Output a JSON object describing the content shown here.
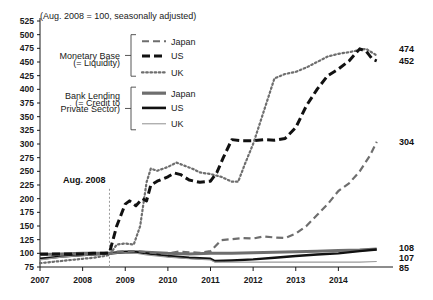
{
  "chart_data": {
    "type": "line",
    "title": "",
    "subtitle": "(Aug. 2008 = 100, seasonally adjusted)",
    "xlabel": "",
    "ylabel": "",
    "ylim": [
      75,
      525
    ],
    "xlim": [
      2007.0,
      2015.0
    ],
    "y_ticks": [
      75,
      100,
      125,
      150,
      175,
      200,
      225,
      250,
      275,
      300,
      325,
      350,
      375,
      400,
      425,
      450,
      475,
      500,
      525
    ],
    "x_ticks": [
      2007,
      2008,
      2009,
      2010,
      2011,
      2012,
      2013,
      2014
    ],
    "x_tick_labels": [
      "2007",
      "2008",
      "2009",
      "2010",
      "2011",
      "2012",
      "2013",
      "2014"
    ],
    "grid": false,
    "legend_position": "upper-left-inside",
    "annotations": [
      {
        "text": "Aug. 2008",
        "x": 2008.63,
        "y": 233,
        "type": "vline-label"
      }
    ],
    "vline": {
      "x": 2008.63,
      "label": "Aug. 2008",
      "style": "dotted",
      "color": "#9a9a9a"
    },
    "end_labels": [
      {
        "text": "474",
        "series": "Monetary Base UK",
        "value": 474
      },
      {
        "text": "452",
        "series": "Monetary Base US",
        "value": 452
      },
      {
        "text": "304",
        "series": "Monetary Base Japan",
        "value": 304
      },
      {
        "text": "108",
        "series": "Bank Lending Japan",
        "value": 108
      },
      {
        "text": "107",
        "series": "Bank Lending US",
        "value": 107
      },
      {
        "text": "85",
        "series": "Bank Lending UK",
        "value": 85
      }
    ],
    "series": [
      {
        "name": "Japan",
        "group": "Monetary Base (= Liquidity)",
        "style": "dashed",
        "color": "#6e6e6e",
        "width": 2.2,
        "dash": "7,4",
        "x": [
          2007.0,
          2007.25,
          2007.5,
          2007.75,
          2008.0,
          2008.25,
          2008.5,
          2008.63,
          2008.75,
          2009.0,
          2009.25,
          2009.5,
          2009.75,
          2010.0,
          2010.25,
          2010.5,
          2010.75,
          2011.0,
          2011.25,
          2011.5,
          2011.75,
          2012.0,
          2012.25,
          2012.5,
          2012.75,
          2013.0,
          2013.25,
          2013.5,
          2013.75,
          2014.0,
          2014.25,
          2014.5,
          2014.75,
          2014.9
        ],
        "values": [
          98,
          97,
          98,
          99,
          99,
          99,
          100,
          100,
          103,
          104,
          104,
          102,
          100,
          100,
          103,
          102,
          101,
          104,
          124,
          126,
          128,
          127,
          131,
          129,
          128,
          136,
          150,
          170,
          190,
          214,
          228,
          250,
          280,
          304
        ]
      },
      {
        "name": "US",
        "group": "Monetary Base (= Liquidity)",
        "style": "dashed-bold",
        "color": "#111111",
        "width": 3.0,
        "dash": "8,4",
        "x": [
          2007.0,
          2007.25,
          2007.5,
          2007.75,
          2008.0,
          2008.25,
          2008.5,
          2008.63,
          2008.8,
          2009.0,
          2009.1,
          2009.25,
          2009.4,
          2009.5,
          2009.6,
          2009.75,
          2010.0,
          2010.15,
          2010.3,
          2010.5,
          2010.75,
          2011.0,
          2011.15,
          2011.3,
          2011.5,
          2011.75,
          2012.0,
          2012.25,
          2012.5,
          2012.75,
          2013.0,
          2013.25,
          2013.5,
          2013.75,
          2014.0,
          2014.25,
          2014.5,
          2014.65,
          2014.8,
          2014.9
        ],
        "values": [
          99,
          99,
          99,
          99,
          99,
          100,
          100,
          101,
          150,
          190,
          196,
          187,
          200,
          196,
          225,
          232,
          240,
          247,
          244,
          234,
          230,
          232,
          248,
          275,
          308,
          306,
          306,
          308,
          307,
          310,
          330,
          370,
          400,
          425,
          437,
          452,
          474,
          470,
          455,
          452
        ]
      },
      {
        "name": "UK",
        "group": "Monetary Base (= Liquidity)",
        "style": "dotted",
        "color": "#6e6e6e",
        "width": 2.2,
        "dash": "1.6,2.6",
        "x": [
          2007.0,
          2007.25,
          2007.5,
          2007.75,
          2008.0,
          2008.25,
          2008.5,
          2008.63,
          2008.8,
          2009.0,
          2009.2,
          2009.35,
          2009.5,
          2009.6,
          2009.75,
          2010.0,
          2010.2,
          2010.4,
          2010.6,
          2010.75,
          2011.0,
          2011.25,
          2011.5,
          2011.65,
          2011.8,
          2012.0,
          2012.25,
          2012.5,
          2012.75,
          2013.0,
          2013.25,
          2013.5,
          2013.75,
          2014.0,
          2014.25,
          2014.5,
          2014.65,
          2014.9
        ],
        "values": [
          82,
          84,
          86,
          88,
          90,
          92,
          95,
          97,
          116,
          118,
          116,
          150,
          230,
          255,
          251,
          258,
          266,
          260,
          254,
          248,
          245,
          240,
          231,
          231,
          262,
          300,
          360,
          420,
          428,
          432,
          440,
          450,
          460,
          465,
          468,
          472,
          474,
          462
        ]
      },
      {
        "name": "Japan",
        "group": "Bank Lending (= Credit to Private Sector)",
        "style": "solid-bold",
        "color": "#6e6e6e",
        "width": 3.0,
        "dash": "none",
        "x": [
          2007.0,
          2007.5,
          2008.0,
          2008.5,
          2008.63,
          2009.0,
          2009.25,
          2009.5,
          2010.0,
          2010.5,
          2011.0,
          2011.5,
          2012.0,
          2012.5,
          2013.0,
          2013.5,
          2014.0,
          2014.5,
          2014.9
        ],
        "values": [
          98,
          99,
          100,
          100,
          100,
          103,
          103,
          102,
          100,
          99,
          100,
          100,
          101,
          102,
          103,
          104,
          105,
          106,
          108
        ]
      },
      {
        "name": "US",
        "group": "Bank Lending (= Credit to Private Sector)",
        "style": "solid-bold",
        "color": "#111111",
        "width": 2.4,
        "dash": "none",
        "x": [
          2007.0,
          2007.5,
          2008.0,
          2008.5,
          2008.63,
          2009.0,
          2009.25,
          2009.5,
          2010.0,
          2010.5,
          2011.0,
          2011.1,
          2011.5,
          2012.0,
          2012.5,
          2013.0,
          2013.5,
          2014.0,
          2014.5,
          2014.9
        ],
        "values": [
          90,
          94,
          97,
          99,
          100,
          102,
          102,
          100,
          95,
          92,
          90,
          86,
          87,
          89,
          92,
          95,
          98,
          100,
          104,
          107
        ]
      },
      {
        "name": "UK",
        "group": "Bank Lending (= Credit to Private Sector)",
        "style": "solid-thin",
        "color": "#9a9a9a",
        "width": 1.1,
        "dash": "none",
        "x": [
          2007.0,
          2007.5,
          2008.0,
          2008.5,
          2008.63,
          2009.0,
          2009.25,
          2009.5,
          2010.0,
          2010.5,
          2011.0,
          2011.1,
          2011.5,
          2012.0,
          2012.5,
          2013.0,
          2013.5,
          2014.0,
          2014.5,
          2014.9
        ],
        "values": [
          88,
          93,
          96,
          99,
          100,
          101,
          100,
          97,
          93,
          90,
          88,
          84,
          84,
          84,
          84,
          84,
          84,
          84,
          84,
          85
        ]
      }
    ],
    "legend_groups": [
      {
        "group_label_lines": [
          "Monetary Base",
          "(= Liquidity)"
        ],
        "entries": [
          {
            "label": "Japan",
            "style": "dashed",
            "color": "#6e6e6e",
            "dash": "7,4",
            "width": 2.2
          },
          {
            "label": "US",
            "style": "dashed-bold",
            "color": "#111111",
            "dash": "8,4",
            "width": 3.2
          },
          {
            "label": "UK",
            "style": "dotted",
            "color": "#6e6e6e",
            "dash": "1.6,2.6",
            "width": 2.2
          }
        ]
      },
      {
        "group_label_lines": [
          "Bank Lending",
          "(= Credit to",
          "Private Sector)"
        ],
        "entries": [
          {
            "label": "Japan",
            "style": "solid-bold",
            "color": "#6e6e6e",
            "dash": "none",
            "width": 3.2
          },
          {
            "label": "US",
            "style": "solid-bold",
            "color": "#111111",
            "dash": "none",
            "width": 2.6
          },
          {
            "label": "UK",
            "style": "solid-thin",
            "color": "#9a9a9a",
            "dash": "none",
            "width": 1.1
          }
        ]
      }
    ]
  }
}
